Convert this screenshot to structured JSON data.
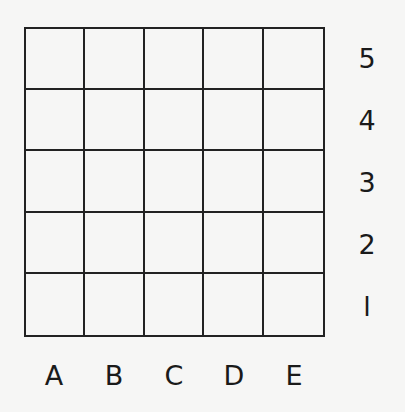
{
  "grid": {
    "rows": 5,
    "columns": 5,
    "line_color": "#222222",
    "background": "#f6f6f5"
  },
  "row_labels": [
    "5",
    "4",
    "3",
    "2",
    "l"
  ],
  "column_labels": [
    "A",
    "B",
    "C",
    "D",
    "E"
  ]
}
